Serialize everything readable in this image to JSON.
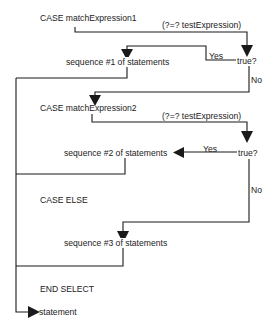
{
  "diagram": {
    "type": "flowchart",
    "colors": {
      "line": "#1a1a1a",
      "text": "#222222",
      "background": "#ffffff"
    },
    "nodes": {
      "case1": "CASE matchExpression1",
      "test1": "(?=? testExpression)",
      "decision1": "true?",
      "yes1": "Yes",
      "seq1": "sequence #1 of statements",
      "no1": "No",
      "case2": "CASE matchExpression2",
      "test2": "(?=? testExpression)",
      "decision2": "true?",
      "yes2": "Yes",
      "seq2": "sequence #2 of statements",
      "no2": "No",
      "case_else": "CASE ELSE",
      "seq3": "sequence #3 of statements",
      "end_select": "END SELECT",
      "statement": "statement"
    },
    "edges": [
      {
        "from": "case1",
        "to": "decision1",
        "label": "(?=? testExpression)"
      },
      {
        "from": "decision1",
        "to": "seq1",
        "label": "Yes"
      },
      {
        "from": "decision1",
        "to": "case2",
        "label": "No"
      },
      {
        "from": "seq1",
        "to": "statement",
        "label": ""
      },
      {
        "from": "case2",
        "to": "decision2",
        "label": "(?=? testExpression)"
      },
      {
        "from": "decision2",
        "to": "seq2",
        "label": "Yes"
      },
      {
        "from": "decision2",
        "to": "seq3",
        "label": "No"
      },
      {
        "from": "seq2",
        "to": "statement",
        "label": ""
      },
      {
        "from": "seq3",
        "to": "statement",
        "label": ""
      }
    ]
  }
}
